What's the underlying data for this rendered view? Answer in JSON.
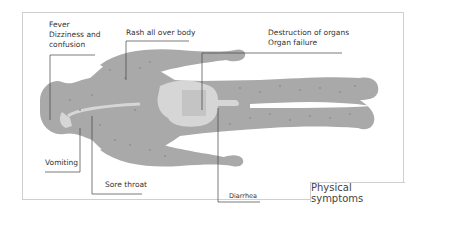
{
  "diagram": {
    "title": "Physical symptoms",
    "labels": [
      {
        "id": "fever",
        "lines": [
          "Fever",
          "Dizziness and",
          "confusion"
        ]
      },
      {
        "id": "rash",
        "text": "Rash all over body"
      },
      {
        "id": "organs",
        "lines": [
          "Destruction of organs",
          "Organ failure"
        ]
      },
      {
        "id": "vomiting",
        "text": "Vomiting"
      },
      {
        "id": "sore-throat",
        "text": "Sore throat"
      },
      {
        "id": "diarrhea",
        "text": "Diarrhea"
      }
    ],
    "colors": {
      "body": "#a9a9a9",
      "organ_highlight": "#d6d6d6",
      "rash_dot": "#8c8c8c",
      "leader_line": "#444444",
      "frame": "#cfcfcf"
    }
  }
}
